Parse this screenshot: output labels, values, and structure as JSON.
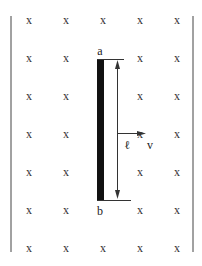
{
  "diagram": {
    "title": "",
    "field_symbol": "x",
    "field_grid": {
      "columns_x": [
        29,
        66,
        103,
        140,
        177
      ],
      "rows_y": [
        20,
        58,
        96,
        134,
        172,
        210,
        248
      ]
    },
    "rod": {
      "top_label": "a",
      "bottom_label": "b",
      "color": "#111111"
    },
    "length_label": "ℓ",
    "velocity_label": "v",
    "line_color": "#333333"
  }
}
